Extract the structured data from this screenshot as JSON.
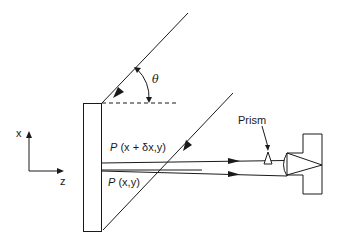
{
  "diagram": {
    "type": "optical-setup",
    "colors": {
      "ink": "#1a1a1a",
      "background": "#ffffff"
    },
    "labels": {
      "theta": "θ",
      "point_upper_P": "P",
      "point_upper_coords": "(x + δx,y)",
      "point_lower_P": "P",
      "point_lower_coords": "(x,y)",
      "prism": "Prism",
      "axis_x": "x",
      "axis_z": "z"
    },
    "components": [
      {
        "id": "specimen-plate",
        "label": ""
      },
      {
        "id": "incident-beam-upper",
        "label": ""
      },
      {
        "id": "incident-beam-lower",
        "label": ""
      },
      {
        "id": "reference-dashed-line",
        "label": ""
      },
      {
        "id": "angle-arc",
        "label": "θ"
      },
      {
        "id": "scattered-beam-upper",
        "label": "P (x + δx,y)"
      },
      {
        "id": "scattered-beam-lower",
        "label": "P (x,y)"
      },
      {
        "id": "prism",
        "label": "Prism"
      },
      {
        "id": "lens",
        "label": ""
      },
      {
        "id": "camera",
        "label": ""
      },
      {
        "id": "coordinate-axes",
        "label": "x, z"
      }
    ]
  }
}
